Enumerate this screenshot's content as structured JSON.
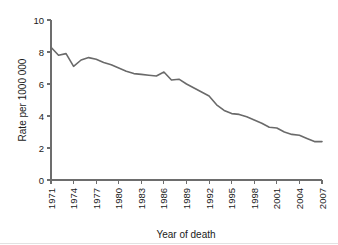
{
  "chart_data": {
    "type": "line",
    "title": "",
    "xlabel": "Year of death",
    "ylabel": "Rate per 1000 000",
    "xlim": [
      1971,
      2007
    ],
    "ylim": [
      0,
      10
    ],
    "grid": false,
    "legend": false,
    "legend_position": "none",
    "line_color": "#6a6a6a",
    "axis_color": "#6d6d6d",
    "x_tick_labels": [
      "1971",
      "1974",
      "1977",
      "1980",
      "1983",
      "1986",
      "1989",
      "1992",
      "1995",
      "1998",
      "2001",
      "2004",
      "2007"
    ],
    "x_tick_values": [
      1971,
      1974,
      1977,
      1980,
      1983,
      1986,
      1989,
      1992,
      1995,
      1998,
      2001,
      2004,
      2007
    ],
    "y_tick_labels": [
      "0",
      "2",
      "4",
      "6",
      "8",
      "10"
    ],
    "y_tick_values": [
      0,
      2,
      4,
      6,
      8,
      10
    ],
    "x": [
      1971,
      1972,
      1973,
      1974,
      1975,
      1976,
      1977,
      1978,
      1979,
      1980,
      1981,
      1982,
      1983,
      1984,
      1985,
      1986,
      1987,
      1988,
      1989,
      1990,
      1991,
      1992,
      1993,
      1994,
      1995,
      1996,
      1997,
      1998,
      1999,
      2000,
      2001,
      2002,
      2003,
      2004,
      2005,
      2006,
      2007
    ],
    "values": [
      8.3,
      7.8,
      7.9,
      7.1,
      7.5,
      7.65,
      7.55,
      7.35,
      7.2,
      7.0,
      6.8,
      6.65,
      6.6,
      6.55,
      6.5,
      6.75,
      6.25,
      6.3,
      6.0,
      5.75,
      5.5,
      5.25,
      4.7,
      4.35,
      4.15,
      4.1,
      3.95,
      3.75,
      3.55,
      3.3,
      3.25,
      3.0,
      2.85,
      2.8,
      2.6,
      2.4,
      2.4
    ],
    "series": [
      {
        "name": "Rate per 1000 000",
        "values": [
          8.3,
          7.8,
          7.9,
          7.1,
          7.5,
          7.65,
          7.55,
          7.35,
          7.2,
          7.0,
          6.8,
          6.65,
          6.6,
          6.55,
          6.5,
          6.75,
          6.25,
          6.3,
          6.0,
          5.75,
          5.5,
          5.25,
          4.7,
          4.35,
          4.15,
          4.1,
          3.95,
          3.75,
          3.55,
          3.3,
          3.25,
          3.0,
          2.85,
          2.8,
          2.6,
          2.4,
          2.4
        ]
      }
    ]
  }
}
